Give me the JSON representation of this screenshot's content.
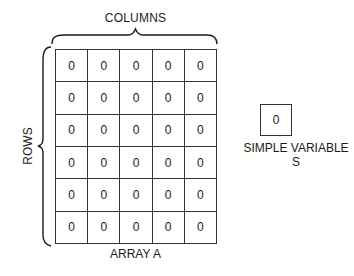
{
  "diagram": {
    "columns_label": "COLUMNS",
    "rows_label": "ROWS",
    "array_label": "ARRAY A",
    "array": {
      "rows": 6,
      "cols": 5,
      "values": [
        [
          "0",
          "0",
          "0",
          "0",
          "0"
        ],
        [
          "0",
          "0",
          "0",
          "0",
          "0"
        ],
        [
          "0",
          "0",
          "0",
          "0",
          "0"
        ],
        [
          "0",
          "0",
          "0",
          "0",
          "0"
        ],
        [
          "0",
          "0",
          "0",
          "0",
          "0"
        ],
        [
          "0",
          "0",
          "0",
          "0",
          "0"
        ]
      ]
    },
    "variable": {
      "value": "0",
      "label": "SIMPLE VARIABLE S"
    }
  }
}
